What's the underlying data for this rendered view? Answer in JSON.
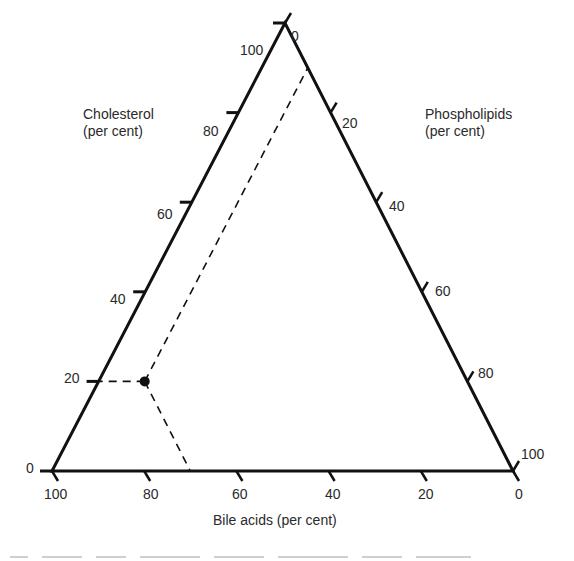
{
  "chart_data": {
    "type": "ternary",
    "title": "",
    "axes": {
      "left": {
        "label_line1": "Cholesterol",
        "label_line2": "(per cent)",
        "ticks": [
          "0",
          "20",
          "40",
          "60",
          "80",
          "100"
        ]
      },
      "right": {
        "label_line1": "Phospholipids",
        "label_line2": "(per cent)",
        "ticks": [
          "0",
          "20",
          "40",
          "60",
          "80",
          "100"
        ]
      },
      "bottom": {
        "label": "Bile acids (per cent)",
        "ticks": [
          "100",
          "80",
          "60",
          "40",
          "20",
          "0"
        ]
      }
    },
    "points": [
      {
        "cholesterol": 20,
        "bile_acids": 70,
        "phospholipids": 10,
        "marker": "filled-circle"
      }
    ],
    "guide_lines": "dashed lines from point to each axis",
    "grid": false,
    "legend": "none"
  },
  "colors": {
    "line": "#111111",
    "text": "#2a2a2a",
    "background": "#ffffff"
  }
}
